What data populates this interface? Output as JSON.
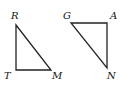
{
  "diagram": {
    "triangles": [
      {
        "name": "RTM",
        "vertices": [
          {
            "label": "R",
            "x": 16,
            "y": 25,
            "lx": 11,
            "ly": 19
          },
          {
            "label": "T",
            "x": 16,
            "y": 70,
            "lx": 4,
            "ly": 79
          },
          {
            "label": "M",
            "x": 51,
            "y": 70,
            "lx": 52,
            "ly": 79
          }
        ]
      },
      {
        "name": "GAN",
        "vertices": [
          {
            "label": "G",
            "x": 71,
            "y": 23,
            "lx": 63,
            "ly": 19
          },
          {
            "label": "A",
            "x": 107,
            "y": 23,
            "lx": 110,
            "ly": 19
          },
          {
            "label": "N",
            "x": 107,
            "y": 68,
            "lx": 107,
            "ly": 79
          }
        ]
      }
    ]
  }
}
